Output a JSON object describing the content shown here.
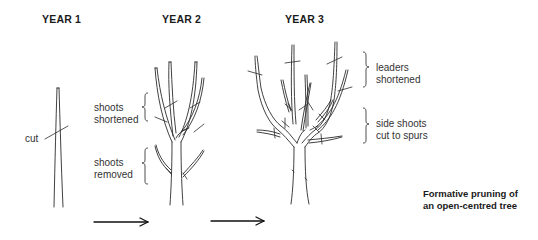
{
  "stages": [
    {
      "heading": "YEAR 1",
      "labels": [
        "cut"
      ]
    },
    {
      "heading": "YEAR 2",
      "labels": [
        "shoots shortened",
        "shoots removed"
      ]
    },
    {
      "heading": "YEAR 3",
      "labels": [
        "leaders shortened",
        "side shoots cut to spurs"
      ]
    }
  ],
  "labels": {
    "cut": "cut",
    "y2_shortened_l1": "shoots",
    "y2_shortened_l2": "shortened",
    "y2_removed_l1": "shoots",
    "y2_removed_l2": "removed",
    "y3_leaders_l1": "leaders",
    "y3_leaders_l2": "shortened",
    "y3_side_l1": "side shoots",
    "y3_side_l2": "cut to spurs"
  },
  "headings": {
    "year1": "YEAR 1",
    "year2": "YEAR 2",
    "year3": "YEAR 3"
  },
  "caption": {
    "line1": "Formative pruning of",
    "line2": "an open-centred tree"
  },
  "arrows": [
    {
      "from": "YEAR 2",
      "to": "YEAR 3"
    },
    {
      "from": "YEAR 3",
      "to": "YEAR 3 result"
    }
  ],
  "colors": {
    "ink": "#2b2b2b",
    "background": "#ffffff"
  }
}
